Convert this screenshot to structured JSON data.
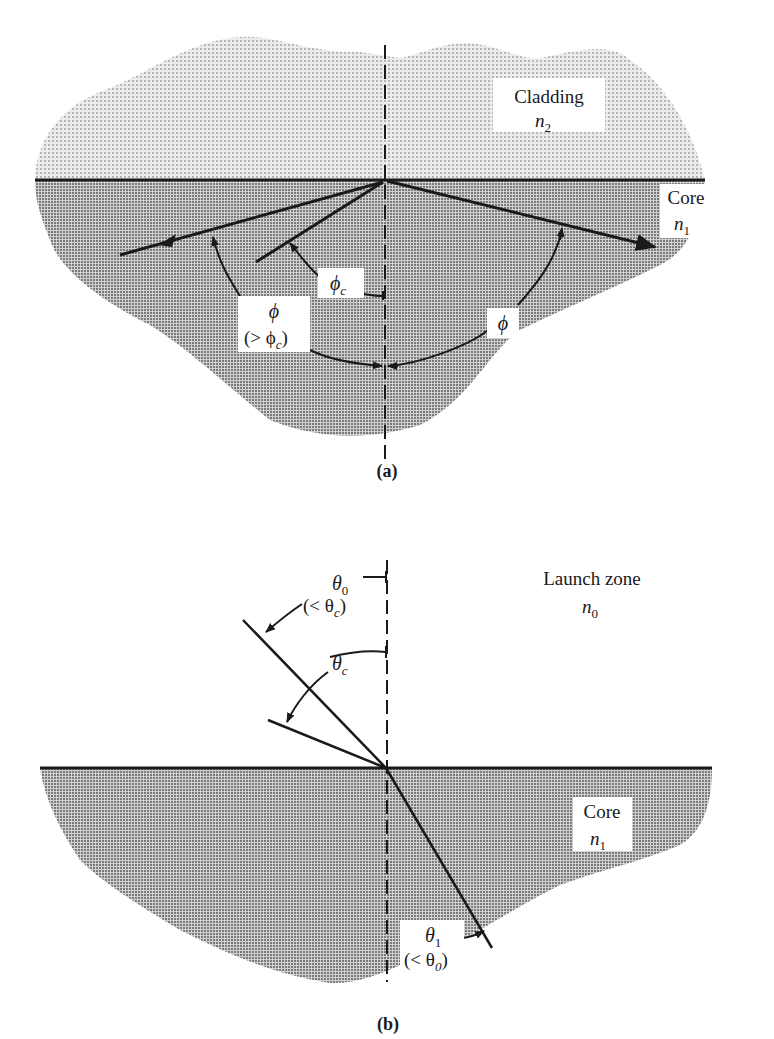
{
  "figure_a": {
    "caption": "(a)",
    "regions": {
      "cladding": {
        "name": "Cladding",
        "index_base": "n",
        "index_sub": "2"
      },
      "core": {
        "name": "Core",
        "index_base": "n",
        "index_sub": "1"
      }
    },
    "labels": {
      "phi_c_base": "ϕ",
      "phi_c_sub": "c",
      "phi_left_line1": "ϕ",
      "phi_left_line2_open": "(> ϕ",
      "phi_left_line2_sub": "c",
      "phi_left_line2_close": ")",
      "phi_right": "ϕ"
    }
  },
  "figure_b": {
    "caption": "(b)",
    "regions": {
      "launch_zone": {
        "name": "Launch zone",
        "index_base": "n",
        "index_sub": "0"
      },
      "core": {
        "name": "Core",
        "index_base": "n",
        "index_sub": "1"
      }
    },
    "labels": {
      "theta0_base": "θ",
      "theta0_sub": "0",
      "theta0_cond_open": "(< θ",
      "theta0_cond_sub": "c",
      "theta0_cond_close": ")",
      "thetac_base": "θ",
      "thetac_sub": "c",
      "theta1_base": "θ",
      "theta1_sub": "1",
      "theta1_cond_open": "(< θ",
      "theta1_cond_sub": "0",
      "theta1_cond_close": ")"
    }
  },
  "colors": {
    "line": "#1a1a1a",
    "cladding_fill": "#d4d4d4",
    "core_fill": "#a9a9a9",
    "label_bg": "#ffffff"
  }
}
